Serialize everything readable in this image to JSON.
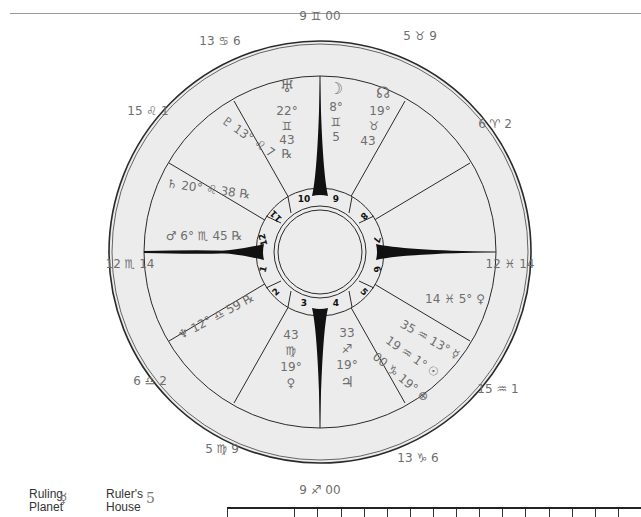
{
  "chart": {
    "house_numbers": [
      "1",
      "2",
      "3",
      "4",
      "5",
      "6",
      "7",
      "8",
      "9",
      "10",
      "11",
      "12"
    ],
    "cusps": {
      "mc": "9 ♊ 00",
      "ic": "9 ♐ 00",
      "asc": "12 ♏ 14",
      "desc": "12 ♓ 14",
      "house11": "13 ♋ 6",
      "house12": "15 ♌ 1",
      "house2": "6 ♎ 2",
      "house3": "5 ♍ 9",
      "house5": "13 ♑ 6",
      "house6": "15 ♒ 1",
      "house8": "6 ♈ 2",
      "house9": "5 ♉ 9"
    },
    "planets": {
      "uranus": {
        "glyph": "♅",
        "lines": [
          "22°",
          "♊",
          "43",
          "℞"
        ]
      },
      "moon": {
        "glyph": "☽",
        "lines": [
          "8°",
          "♊",
          "5"
        ]
      },
      "node": {
        "glyph": "☊",
        "lines": [
          "19°",
          "♉",
          "43"
        ]
      },
      "pluto": {
        "text": "♇ 13° ♌ 7"
      },
      "saturn": {
        "text": "♄ 20° ♌ 38 ℞"
      },
      "mars": {
        "text": "♂ 6° ♏ 45 ℞"
      },
      "venus": {
        "text": "14 ♓ 5° ♀"
      },
      "mercury": {
        "text": "35 ♒ 13° ☿"
      },
      "sun": {
        "text": "19 ♒ 1° ☉"
      },
      "pof": {
        "text": "00 ♑ 19° ⊕"
      },
      "neptune": {
        "text": "♆ 12° ♎ 59 ℞"
      },
      "ceres_col": {
        "lines": [
          "43",
          "♍",
          "19°",
          "♀"
        ]
      },
      "jupiter_col": {
        "lines": [
          "33",
          "♐",
          "19°",
          "♃"
        ]
      }
    }
  },
  "legend": {
    "ruling_planet_label_1": "Ruling",
    "ruling_planet_label_2": "Planet",
    "ruling_planet_value": "☿",
    "rulers_house_label_1": "Ruler's",
    "rulers_house_label_2": "House",
    "rulers_house_value": "5"
  },
  "colors": {
    "ring_fill": "#ebebeb",
    "line": "#2a2a2a",
    "ink": "#6e6e6e"
  }
}
